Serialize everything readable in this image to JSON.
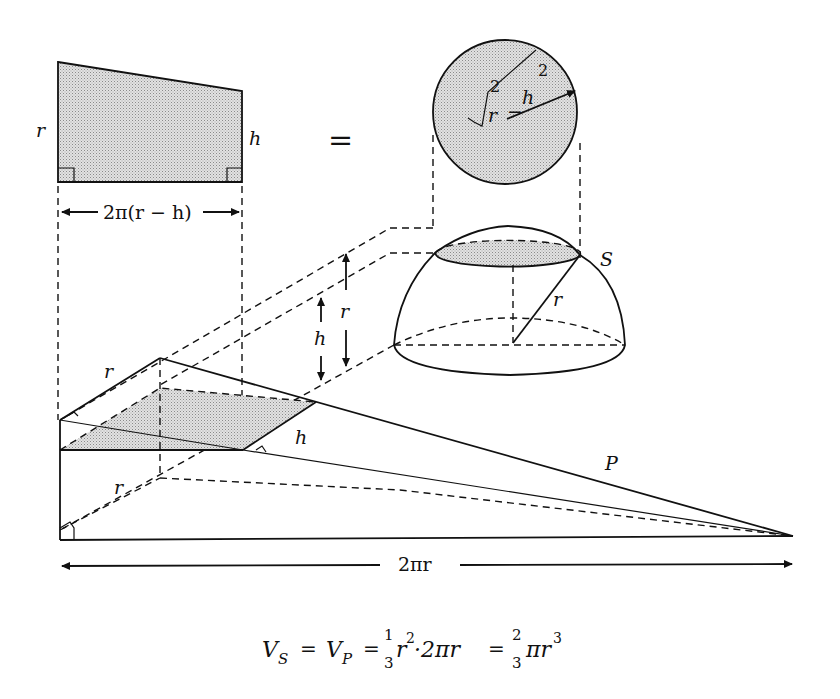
{
  "figure": {
    "labels": {
      "trapezoid_left": "r",
      "trapezoid_right": "h",
      "trapezoid_width": "2π(r − h)",
      "equals": "=",
      "disc_radius_root": "√",
      "disc_r": "r",
      "disc_r_exp": "2",
      "disc_minus": "−",
      "disc_h": "h",
      "disc_h_exp": "2",
      "hemisphere": "S",
      "hemisphere_radius": "r",
      "height_h": "h",
      "height_r": "r",
      "pyramid_edge_r_top": "r",
      "pyramid_edge_h": "h",
      "pyramid_edge_r_bottom": "r",
      "pyramid": "P",
      "base_length": "2πr"
    },
    "formula": {
      "vs": "V",
      "vs_sub": "S",
      "eq1": "=",
      "vp": "V",
      "vp_sub": "P",
      "eq2": "=",
      "frac1_num": "1",
      "frac1_den": "3",
      "term1": "r",
      "term1_exp": "2",
      "term1_rest": "·2πr",
      "eq3": "=",
      "frac2_num": "2",
      "frac2_den": "3",
      "term2": "πr",
      "term2_exp": "3"
    }
  }
}
